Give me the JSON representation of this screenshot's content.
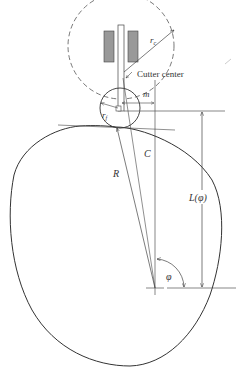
{
  "figure": {
    "type": "cam-cutter-geometry",
    "labels": {
      "cutter_radius": "r",
      "cutter_radius_sub": "c",
      "cutter_center": "Cutter center",
      "offset": "m",
      "follower_radius": "r",
      "follower_radius_sub": "f",
      "contact_distance": "C",
      "radius": "R",
      "length": "L(φ)",
      "angle": "φ"
    },
    "colors": {
      "stroke": "#333333",
      "thin": "#555555",
      "block_fill": "#999999",
      "background": "#ffffff"
    }
  }
}
